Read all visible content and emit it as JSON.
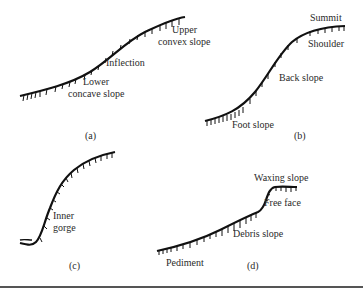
{
  "figure": {
    "panels": [
      {
        "id": "a",
        "caption": "(a)",
        "labels": {
          "upper_1": "Upper",
          "upper_2": "convex slope",
          "inflection": "Inflection",
          "lower_1": "Lower",
          "lower_2": "concave slope"
        }
      },
      {
        "id": "b",
        "caption": "(b)",
        "labels": {
          "summit": "Summit",
          "shoulder": "Shoulder",
          "back_slope": "Back slope",
          "foot_slope": "Foot slope"
        }
      },
      {
        "id": "c",
        "caption": "(c)",
        "labels": {
          "inner_1": "Inner",
          "inner_2": "gorge"
        }
      },
      {
        "id": "d",
        "caption": "(d)",
        "labels": {
          "waxing_slope": "Waxing slope",
          "free_face": "Free face",
          "debris_slope": "Debris slope",
          "pediment": "Pediment"
        }
      }
    ],
    "colors": {
      "line": "#111111",
      "text": "#2a2a2a",
      "rule": "#555555"
    }
  }
}
